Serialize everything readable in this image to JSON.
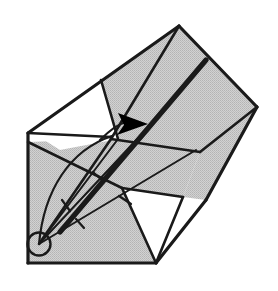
{
  "figure": {
    "caption": "",
    "type": "line-drawing",
    "width": 278,
    "height": 291,
    "background_color": "#ffffff"
  },
  "palette": {
    "paper_shaded": "#cccccc",
    "paper_white": "#ffffff",
    "stroke": "#1a1a1a",
    "crease_heavy": "#1a1a1a",
    "arrow_fill": "#000000",
    "halftone_dot": "#9a9a9a"
  },
  "style": {
    "outline_width": 3.2,
    "crease_width": 2.6,
    "heavy_crease_width": 5.2,
    "thin_width": 2.0,
    "tick_width": 2.2
  },
  "geometry": {
    "pivot": {
      "cx": 39,
      "cy": 244,
      "r": 11.5,
      "label": "pivot-point"
    },
    "apex_top": {
      "x": 179,
      "y": 26
    },
    "corner_right": {
      "x": 257,
      "y": 107
    },
    "corner_left": {
      "x": 28,
      "y": 133
    },
    "corner_bottom_left": {
      "x": 28,
      "y": 263
    },
    "corner_bottom_mid": {
      "x": 156,
      "y": 263
    },
    "node_center": {
      "x": 111,
      "y": 137
    },
    "shaded_regions": [
      {
        "name": "upper-flap",
        "points": "28,133 101,80 179,26 118,139 111,137"
      },
      {
        "name": "main-upper-band",
        "points": "179,26 257,107 200,152 111,139 101,80"
      },
      {
        "name": "right-lower-wedge",
        "points": "257,107 206,200 183,197 200,152"
      },
      {
        "name": "lower-body",
        "points": "28,142 111,139 200,152 183,197 122,188 156,263 28,263"
      }
    ],
    "white_regions": [
      {
        "name": "upper-left-white-panel",
        "points": "30,131 101,80 118,139 60,150"
      },
      {
        "name": "lower-middle-white-triangle",
        "points": "122,188 183,197 156,263"
      }
    ],
    "outline_paths": [
      {
        "name": "outer-left-edge",
        "d": "M 28,133 L 28,263"
      },
      {
        "name": "outer-bottom-edge",
        "d": "M 28,263 L 156,263"
      },
      {
        "name": "outer-top-left-edge",
        "d": "M 28,133 L 179,26"
      },
      {
        "name": "outer-top-right-edge",
        "d": "M 179,26 L 257,107"
      },
      {
        "name": "outer-right-lower-edge",
        "d": "M 257,107 L 206,200"
      },
      {
        "name": "bottom-right-white-edge",
        "d": "M 206,200 L 156,263"
      }
    ],
    "crease_lines": [
      {
        "name": "crease-apex-to-node",
        "d": "M 179,26 L 111,139"
      },
      {
        "name": "crease-node-to-left",
        "d": "M 111,137 L 28,133"
      },
      {
        "name": "crease-flap-edge",
        "d": "M 101,80 L 118,139"
      },
      {
        "name": "crease-node-to-bottomleft",
        "d": "M 111,139 L 39,244"
      },
      {
        "name": "crease-band-lower",
        "d": "M 111,139 L 200,152"
      },
      {
        "name": "crease-right-wedge",
        "d": "M 200,152 L 257,107"
      },
      {
        "name": "crease-white-tri-top",
        "d": "M 122,188 L 183,197"
      },
      {
        "name": "crease-white-tri-left",
        "d": "M 122,188 L 156,263"
      },
      {
        "name": "crease-white-tri-right",
        "d": "M 183,197 L 156,263"
      },
      {
        "name": "crease-lower-left-fold",
        "d": "M 28,142 L 122,188"
      }
    ],
    "heavy_crease": {
      "name": "heavy-fold-crease",
      "d": "M 206,60 L 60,232"
    },
    "fold_rays": [
      {
        "name": "ray-upper",
        "d": "M 39,244 L 118,139"
      },
      {
        "name": "ray-middle",
        "d": "M 39,244 L 155,120"
      },
      {
        "name": "ray-lower",
        "d": "M 39,244 L 196,150"
      }
    ],
    "curved_fold_arc": {
      "name": "fold-motion-arc",
      "d": "M 39,244 C 44,190 70,150 112,136"
    },
    "arrow": {
      "name": "fold-direction-arrow",
      "shaft_d": "M 100,140 C 110,130 118,124 126,122",
      "head_points": "148,124 118,113 124,125 117,135",
      "direction": "right"
    },
    "tick_marks": [
      {
        "name": "tick-mark-1",
        "d": "M 93,172 L 104,182"
      },
      {
        "name": "tick-mark-2",
        "d": "M 119,196 L 131,204"
      },
      {
        "name": "tick-mark-3",
        "d": "M 62,200 L 70,211"
      },
      {
        "name": "tick-mark-4",
        "d": "M 76,219 L 84,228"
      }
    ]
  }
}
